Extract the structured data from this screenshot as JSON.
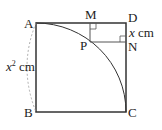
{
  "labels": {
    "A": "A",
    "B": "B",
    "C": "C",
    "D": "D",
    "M": "M",
    "N": "N",
    "P": "P"
  },
  "side_label": {
    "var": "x",
    "exp": "2",
    "unit": " cm"
  },
  "dn_label": {
    "var": "x",
    "unit": " cm"
  }
}
